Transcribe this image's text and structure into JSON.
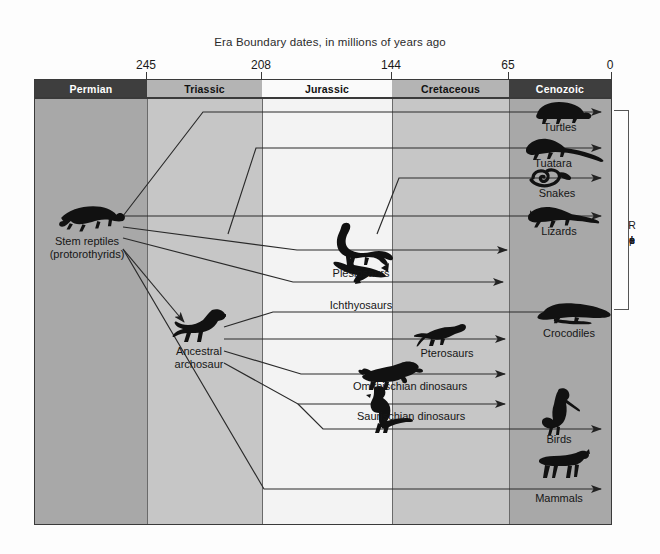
{
  "figure": {
    "caption": "Era Boundary dates, in millions of years ago",
    "type": "diagram",
    "axis": {
      "label": "millions of years ago",
      "ticks": [
        "245",
        "208",
        "144",
        "65",
        "0"
      ],
      "tick_x_px": [
        146,
        261,
        391,
        508,
        611
      ],
      "direction": "oldest on left, present (0) on right"
    },
    "eras": [
      {
        "name": "Permian",
        "start_mya": 290,
        "end_mya": 245,
        "shade": "dark",
        "left_px": 0,
        "width_px": 112
      },
      {
        "name": "Triassic",
        "start_mya": 245,
        "end_mya": 208,
        "shade": "mid",
        "left_px": 112,
        "width_px": 115
      },
      {
        "name": "Jurassic",
        "start_mya": 208,
        "end_mya": 144,
        "shade": "light",
        "left_px": 227,
        "width_px": 130
      },
      {
        "name": "Cretaceous",
        "start_mya": 144,
        "end_mya": 65,
        "shade": "mid",
        "left_px": 357,
        "width_px": 117
      },
      {
        "name": "Cenozoic",
        "start_mya": 65,
        "end_mya": 0,
        "shade": "dark",
        "left_px": 474,
        "width_px": 102
      }
    ],
    "group_bracket": {
      "label": "Reptiles",
      "letters": [
        "R",
        "e",
        "p",
        "t",
        "i",
        "l",
        "e",
        "s"
      ]
    },
    "taxa": [
      {
        "id": "stem-reptiles",
        "label_line1": "Stem reptiles",
        "label_line2": "(protorothyrids)",
        "icon": "lizard-silhouette",
        "extinct": true
      },
      {
        "id": "turtles",
        "label": "Turtles",
        "icon": "turtle-silhouette",
        "extant": true
      },
      {
        "id": "tuatara",
        "label": "Tuatara",
        "icon": "tuatara-silhouette",
        "extant": true
      },
      {
        "id": "snakes",
        "label": "Snakes",
        "icon": "snake-silhouette",
        "extant": true
      },
      {
        "id": "lizards",
        "label": "Lizards",
        "icon": "lizard-silhouette",
        "extant": true
      },
      {
        "id": "plesiosaurs",
        "label": "Plesiosaurs",
        "icon": "plesiosaur-silhouette",
        "extinct_at_mya": 65
      },
      {
        "id": "ichthyosaurs",
        "label": "Ichthyosaurs",
        "icon": "ichthyosaur-silhouette",
        "extinct_at_mya": 90
      },
      {
        "id": "crocodiles",
        "label": "Crocodiles",
        "icon": "crocodile-silhouette",
        "extant": true
      },
      {
        "id": "ancestral-archosaur",
        "label_line1": "Ancestral",
        "label_line2": "archosaur",
        "icon": "archosaur-silhouette",
        "extinct": true
      },
      {
        "id": "pterosaurs",
        "label": "Pterosaurs",
        "icon": "pterosaur-silhouette",
        "extinct_at_mya": 65
      },
      {
        "id": "ornithischian",
        "label": "Omithischian dinosaurs",
        "icon": "triceratops-silhouette",
        "extinct_at_mya": 65
      },
      {
        "id": "saurischian",
        "label": "Saurischian dinosaurs",
        "icon": "theropod-silhouette",
        "extinct_at_mya": 65
      },
      {
        "id": "birds",
        "label": "Birds",
        "icon": "bird-silhouette",
        "extant": true
      },
      {
        "id": "mammals",
        "label": "Mammals",
        "icon": "mammal-silhouette",
        "extant": true
      }
    ],
    "colors": {
      "era_dark": "#3e3e3e",
      "era_mid": "#b4b4b4",
      "era_light": "#fafafa",
      "band_dark": "#a8a8a8",
      "band_mid": "#c6c6c6",
      "band_light": "#f3f3f3",
      "line": "#2a2a2a",
      "text": "#161616",
      "page": "#fdfdfd"
    }
  }
}
